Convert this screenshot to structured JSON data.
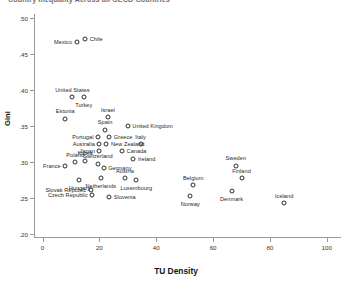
{
  "chart_data": {
    "type": "scatter",
    "title": "Country Inequality Across all OECD Countries",
    "xlabel": "TU Density",
    "ylabel": "Gini",
    "xlim": [
      -3,
      105
    ],
    "ylim": [
      0.195,
      0.505
    ],
    "xticks": [
      0,
      20,
      40,
      60,
      80,
      100
    ],
    "xtick_labels": [
      "0",
      "20",
      "40",
      "60",
      "80",
      "100"
    ],
    "yticks": [
      0.2,
      0.25,
      0.3,
      0.35,
      0.4,
      0.45,
      0.5
    ],
    "ytick_labels": [
      ".20",
      ".25",
      ".30",
      ".35",
      ".40",
      ".45",
      ".50"
    ],
    "grid": false,
    "legend": "none",
    "marker": "open-circle",
    "points": [
      {
        "label": "Mexico",
        "x": 12.0,
        "y": 0.466,
        "pos": "left"
      },
      {
        "label": "Chile",
        "x": 15.0,
        "y": 0.47,
        "pos": "right"
      },
      {
        "label": "United States",
        "x": 10.5,
        "y": 0.39,
        "pos": "above"
      },
      {
        "label": "Turkey",
        "x": 14.5,
        "y": 0.39,
        "pos": "below"
      },
      {
        "label": "Estonia",
        "x": 8.0,
        "y": 0.36,
        "pos": "above"
      },
      {
        "label": "Israel",
        "x": 23.0,
        "y": 0.362,
        "pos": "above"
      },
      {
        "label": "United Kingdom",
        "x": 30.0,
        "y": 0.35,
        "pos": "right"
      },
      {
        "label": "Spain",
        "x": 22.0,
        "y": 0.345,
        "pos": "above"
      },
      {
        "label": "Portugal",
        "x": 19.5,
        "y": 0.335,
        "pos": "left"
      },
      {
        "label": "Greece",
        "x": 23.5,
        "y": 0.335,
        "pos": "right"
      },
      {
        "label": "Australia",
        "x": 20.0,
        "y": 0.325,
        "pos": "left"
      },
      {
        "label": "New Zealand",
        "x": 22.5,
        "y": 0.325,
        "pos": "right"
      },
      {
        "label": "Italy",
        "x": 34.5,
        "y": 0.325,
        "pos": "above"
      },
      {
        "label": "Japan",
        "x": 20.0,
        "y": 0.315,
        "pos": "left"
      },
      {
        "label": "Canada",
        "x": 28.0,
        "y": 0.315,
        "pos": "right"
      },
      {
        "label": "Ireland",
        "x": 32.0,
        "y": 0.305,
        "pos": "right"
      },
      {
        "label": "Poland",
        "x": 11.5,
        "y": 0.3,
        "pos": "above"
      },
      {
        "label": "Korea",
        "x": 15.0,
        "y": 0.302,
        "pos": "above"
      },
      {
        "label": "Switzerland",
        "x": 19.5,
        "y": 0.298,
        "pos": "above"
      },
      {
        "label": "France",
        "x": 8.0,
        "y": 0.295,
        "pos": "left"
      },
      {
        "label": "Germany",
        "x": 21.5,
        "y": 0.292,
        "pos": "right"
      },
      {
        "label": "Hungary",
        "x": 13.0,
        "y": 0.275,
        "pos": "below"
      },
      {
        "label": "Netherlands",
        "x": 20.5,
        "y": 0.278,
        "pos": "below"
      },
      {
        "label": "Austria",
        "x": 29.0,
        "y": 0.278,
        "pos": "above"
      },
      {
        "label": "Luxembourg",
        "x": 33.0,
        "y": 0.275,
        "pos": "below"
      },
      {
        "label": "Slovak Republic",
        "x": 17.0,
        "y": 0.262,
        "pos": "left"
      },
      {
        "label": "Czech Republic",
        "x": 17.5,
        "y": 0.255,
        "pos": "left"
      },
      {
        "label": "Slovenia",
        "x": 23.5,
        "y": 0.252,
        "pos": "right"
      },
      {
        "label": "Belgium",
        "x": 53.0,
        "y": 0.268,
        "pos": "above"
      },
      {
        "label": "Norway",
        "x": 52.0,
        "y": 0.253,
        "pos": "below"
      },
      {
        "label": "Sweden",
        "x": 68.0,
        "y": 0.295,
        "pos": "above"
      },
      {
        "label": "Finland",
        "x": 70.0,
        "y": 0.278,
        "pos": "above"
      },
      {
        "label": "Denmark",
        "x": 66.5,
        "y": 0.26,
        "pos": "below"
      },
      {
        "label": "Iceland",
        "x": 85.0,
        "y": 0.243,
        "pos": "above"
      }
    ]
  }
}
